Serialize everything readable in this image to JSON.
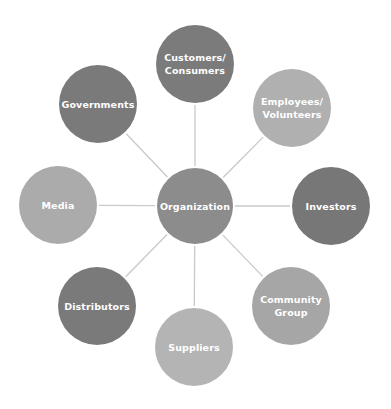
{
  "diagram": {
    "type": "stakeholder-hub",
    "center": {
      "id": "organization",
      "label": "Organization",
      "cx": 195,
      "cy": 206,
      "r": 38,
      "color": "#8c8c8c"
    },
    "nodes": [
      {
        "id": "customers",
        "label": "Customers/\nConsumers",
        "cx": 195,
        "cy": 64,
        "r": 39,
        "color": "#7b7b7b"
      },
      {
        "id": "employees",
        "label": "Employees/\nVolunteers",
        "cx": 292,
        "cy": 108,
        "r": 39,
        "color": "#b0b0b0"
      },
      {
        "id": "investors",
        "label": "Investors",
        "cx": 331,
        "cy": 206,
        "r": 39,
        "color": "#777777"
      },
      {
        "id": "community-group",
        "label": "Community\nGroup",
        "cx": 291,
        "cy": 306,
        "r": 39,
        "color": "#a6a6a6"
      },
      {
        "id": "suppliers",
        "label": "Suppliers",
        "cx": 194,
        "cy": 347,
        "r": 39,
        "color": "#b4b4b4"
      },
      {
        "id": "distributors",
        "label": "Distributors",
        "cx": 97,
        "cy": 306,
        "r": 39,
        "color": "#7a7a7a"
      },
      {
        "id": "media",
        "label": "Media",
        "cx": 58,
        "cy": 205,
        "r": 39,
        "color": "#ababab"
      },
      {
        "id": "governments",
        "label": "Governments",
        "cx": 98,
        "cy": 104,
        "r": 39,
        "color": "#7a7a7a"
      }
    ],
    "connector_color": "#c9c9c9"
  }
}
